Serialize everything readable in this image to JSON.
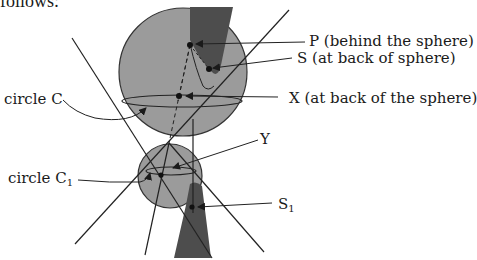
{
  "header": {
    "cut_text": "follows:"
  },
  "labels": {
    "P": "P (behind the sphere)",
    "S": "S   (at back of sphere)",
    "X": "X  (at back of the sphere)",
    "Y": "Y",
    "circleC": "circle C",
    "circleC1_main": "circle C",
    "circleC1_sub": "1",
    "S1_main": "S",
    "S1_sub": "1"
  },
  "colors": {
    "sphere_fill": "#9a9a9a",
    "dark_body": "#4a4a4a",
    "line": "#222222",
    "background": "#ffffff"
  }
}
